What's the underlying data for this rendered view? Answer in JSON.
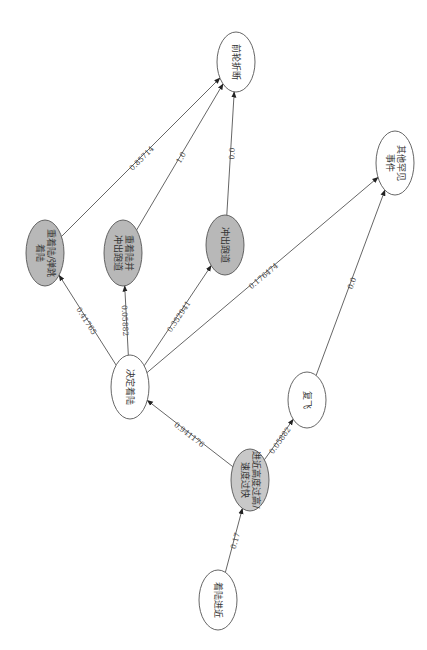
{
  "diagram": {
    "orientation": "rotated-90-clockwise",
    "nodes": [
      {
        "id": "approach",
        "label": "着陆进近",
        "lines": [
          "着陆进近"
        ],
        "cx": 218,
        "cy": 600,
        "rx": 19,
        "ry": 30,
        "fill": "#ffffff"
      },
      {
        "id": "too_high_fast",
        "label": "进近高度过高/速度过快",
        "lines": [
          "进近高度过高/",
          "速度过快"
        ],
        "cx": 250,
        "cy": 480,
        "rx": 19,
        "ry": 31,
        "fill": "#c8c8c8"
      },
      {
        "id": "go_around",
        "label": "复飞",
        "lines": [
          "复飞"
        ],
        "cx": 307,
        "cy": 400,
        "rx": 19,
        "ry": 28,
        "fill": "#ffffff"
      },
      {
        "id": "decide_land",
        "label": "决定着陆",
        "lines": [
          "决定着陆"
        ],
        "cx": 130,
        "cy": 387,
        "rx": 19,
        "ry": 32,
        "fill": "#ffffff"
      },
      {
        "id": "hard_bounce",
        "label": "重着陆/弹跳着陆",
        "lines": [
          "重着陆/弹跳",
          "着陆"
        ],
        "cx": 45,
        "cy": 253,
        "rx": 19,
        "ry": 33,
        "fill": "#b8b8b8"
      },
      {
        "id": "hard_runway",
        "label": "重着陆并冲出跑道",
        "lines": [
          "重着陆并",
          "冲出跑道"
        ],
        "cx": 123,
        "cy": 253,
        "rx": 19,
        "ry": 33,
        "fill": "#b8b8b8"
      },
      {
        "id": "runway_excursion",
        "label": "冲出跑道",
        "lines": [
          "冲出跑道"
        ],
        "cx": 225,
        "cy": 245,
        "rx": 19,
        "ry": 30,
        "fill": "#b8b8b8"
      },
      {
        "id": "other_rare",
        "label": "其他罕见事件",
        "lines": [
          "其他罕见",
          "事件"
        ],
        "cx": 395,
        "cy": 163,
        "rx": 19,
        "ry": 32,
        "fill": "#ffffff"
      },
      {
        "id": "nose_gear",
        "label": "前轮折断",
        "lines": [
          "前轮折断"
        ],
        "cx": 236,
        "cy": 62,
        "rx": 19,
        "ry": 30,
        "fill": "#ffffff"
      }
    ],
    "edges": [
      {
        "from": "approach",
        "to": "too_high_fast",
        "label": "0.17"
      },
      {
        "from": "too_high_fast",
        "to": "decide_land",
        "label": "0.941176"
      },
      {
        "from": "too_high_fast",
        "to": "go_around",
        "label": "0.05882"
      },
      {
        "from": "decide_land",
        "to": "hard_bounce",
        "label": "0.41765"
      },
      {
        "from": "decide_land",
        "to": "hard_runway",
        "label": "0.05882"
      },
      {
        "from": "decide_land",
        "to": "runway_excursion",
        "label": "0.352941"
      },
      {
        "from": "decide_land",
        "to": "other_rare",
        "label": "0.176474"
      },
      {
        "from": "go_around",
        "to": "other_rare",
        "label": "0.0"
      },
      {
        "from": "hard_bounce",
        "to": "nose_gear",
        "label": "0.85714"
      },
      {
        "from": "hard_runway",
        "to": "nose_gear",
        "label": "1.0"
      },
      {
        "from": "runway_excursion",
        "to": "nose_gear",
        "label": "0.0"
      }
    ]
  }
}
